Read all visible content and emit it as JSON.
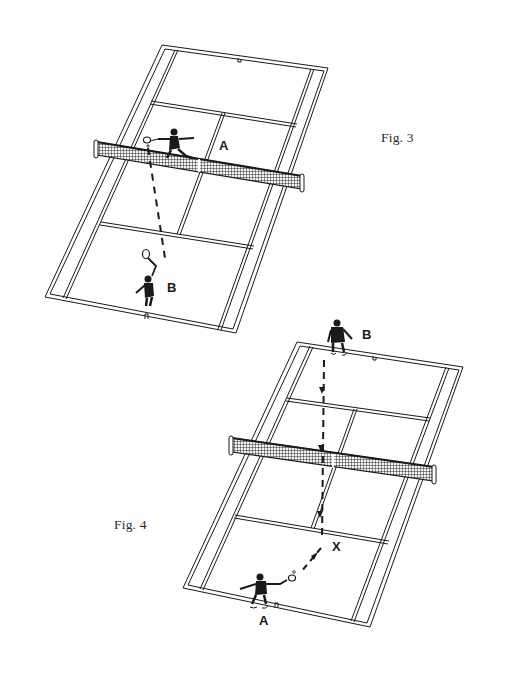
{
  "figures": [
    {
      "id": "fig3",
      "caption": "Fig. 3",
      "players": [
        {
          "label": "A",
          "position": "near net, returning"
        },
        {
          "label": "B",
          "position": "baseline, serving"
        }
      ]
    },
    {
      "id": "fig4",
      "caption": "Fig. 4",
      "players": [
        {
          "label": "B",
          "position": "far baseline, serving"
        },
        {
          "label": "A",
          "position": "near baseline, returning"
        }
      ],
      "marker": "X"
    }
  ],
  "colors": {
    "ink": "#1a1a1a",
    "paper": "#fefefe"
  }
}
